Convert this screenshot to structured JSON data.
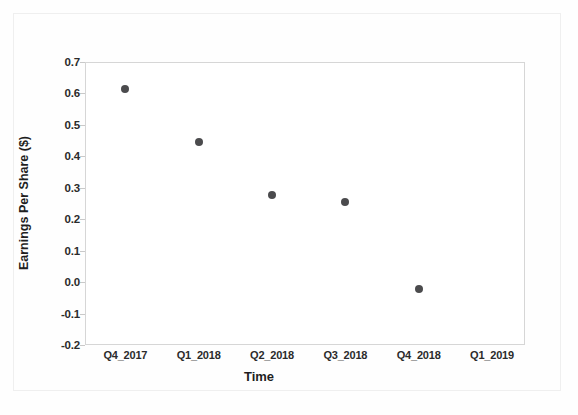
{
  "chart_data": {
    "type": "scatter",
    "title": "",
    "xlabel": "Time",
    "ylabel": "Earnings Per Share ($)",
    "categories": [
      "Q4_2017",
      "Q1_2018",
      "Q2_2018",
      "Q3_2018",
      "Q4_2018",
      "Q1_2019"
    ],
    "series": [
      {
        "name": "Earnings Per Share",
        "values": [
          0.615,
          0.445,
          0.278,
          0.255,
          -0.022,
          null
        ]
      }
    ],
    "ylim": [
      -0.2,
      0.7
    ],
    "yticks": [
      "0.7",
      "0.6",
      "0.5",
      "0.4",
      "0.3",
      "0.2",
      "0.1",
      "0.0",
      "-0.1",
      "-0.2"
    ],
    "ytick_values": [
      0.7,
      0.6,
      0.5,
      0.4,
      0.3,
      0.2,
      0.1,
      0.0,
      -0.1,
      -0.2
    ],
    "grid": false,
    "legend": "none",
    "marker_color": "#4b4b4d",
    "frame_color": "#d6d6d6",
    "background": "#ffffff"
  }
}
